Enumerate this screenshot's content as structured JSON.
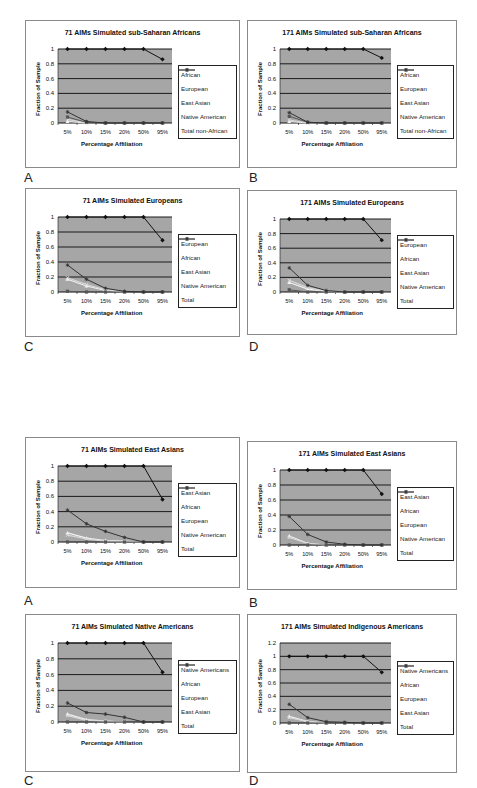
{
  "figure": {
    "x_ticks": [
      "5%",
      "10%",
      "15%",
      "20%",
      "50%",
      "95%"
    ],
    "xlabel": "Percentage Affiliation",
    "ylabel": "Fraction of Sample",
    "series_colors": {
      "primary": "#111111",
      "african_or_european": "#555555",
      "light1": "#f2f2f2",
      "light2": "#d8d8d8",
      "total": "#333333"
    },
    "plot_background": "#a6a6a6"
  },
  "panels": [
    {
      "id": "top-A",
      "letter": "A",
      "title": "71 AIMs Simulated sub-Saharan Africans",
      "legend": [
        "African",
        "European",
        "East Asian",
        "Native American",
        "Total non-African"
      ],
      "y_ticks": [
        "1",
        "0.8",
        "0.6",
        "0.4",
        "0.2",
        "0"
      ]
    },
    {
      "id": "top-B",
      "letter": "B",
      "title": "171 AIMs Simulated sub-Saharan Africans",
      "legend": [
        "African",
        "European",
        "East Asian",
        "Native American",
        "Total non-African"
      ],
      "y_ticks": [
        "1",
        "0.8",
        "0.6",
        "0.4",
        "0.2",
        "0"
      ]
    },
    {
      "id": "top-C",
      "letter": "C",
      "title": "71 AIMs Simulated Europeans",
      "legend": [
        "European",
        "African",
        "East Asian",
        "Native American",
        "Total"
      ],
      "y_ticks": [
        "1",
        "0.8",
        "0.6",
        "0.4",
        "0.2",
        "0"
      ]
    },
    {
      "id": "top-D",
      "letter": "D",
      "title": "171 AIMs Simulated Europeans",
      "legend": [
        "European",
        "African",
        "East Asian",
        "Native American",
        "Total"
      ],
      "y_ticks": [
        "1",
        "0.8",
        "0.6",
        "0.4",
        "0.2",
        "0"
      ]
    },
    {
      "id": "bottom-A",
      "letter": "A",
      "title": "71 AIMs Simulated East Asians",
      "legend": [
        "East Asian",
        "African",
        "European",
        "Native American",
        "Total"
      ],
      "y_ticks": [
        "1",
        "0.8",
        "0.6",
        "0.4",
        "0.2",
        "0"
      ]
    },
    {
      "id": "bottom-B",
      "letter": "B",
      "title": "171 AIMs Simulated East Asians",
      "legend": [
        "East Asian",
        "African",
        "European",
        "Native American",
        "Total"
      ],
      "y_ticks": [
        "1",
        "0.8",
        "0.6",
        "0.4",
        "0.2",
        "0"
      ]
    },
    {
      "id": "bottom-C",
      "letter": "C",
      "title": "71 AIMs Simulated Native Americans",
      "legend": [
        "Native Americans",
        "African",
        "European",
        "East Asian",
        "Total"
      ],
      "y_ticks": [
        "1",
        "0.8",
        "0.6",
        "0.4",
        "0.2",
        "0"
      ]
    },
    {
      "id": "bottom-D",
      "letter": "D",
      "title": "171 AIMs Simulated Indigenous Americans",
      "legend": [
        "Native Americans",
        "African",
        "European",
        "East Asian",
        "Total"
      ],
      "y_ticks": [
        "1.2",
        "1",
        "0.8",
        "0.6",
        "0.4",
        "0.2",
        "0"
      ]
    }
  ],
  "chart_data": [
    {
      "type": "line",
      "title": "71 AIMs Simulated sub-Saharan Africans",
      "panel": "A (top)",
      "categories": [
        "5%",
        "10%",
        "15%",
        "20%",
        "50%",
        "95%"
      ],
      "xlabel": "Percentage Affiliation",
      "ylabel": "Fraction of Sample",
      "ylim": [
        0,
        1
      ],
      "grid": true,
      "legend_position": "right",
      "series": [
        {
          "name": "African",
          "values": [
            1,
            1,
            1,
            1,
            1,
            0.86
          ]
        },
        {
          "name": "European",
          "values": [
            0.08,
            0.01,
            0,
            0,
            0,
            0
          ]
        },
        {
          "name": "East Asian",
          "values": [
            0.02,
            0,
            0,
            0,
            0,
            0
          ]
        },
        {
          "name": "Native American",
          "values": [
            0.05,
            0,
            0,
            0,
            0,
            0
          ]
        },
        {
          "name": "Total non-African",
          "values": [
            0.15,
            0.02,
            0,
            0,
            0,
            0
          ]
        }
      ]
    },
    {
      "type": "line",
      "title": "171 AIMs Simulated sub-Saharan Africans",
      "panel": "B (top)",
      "categories": [
        "5%",
        "10%",
        "15%",
        "20%",
        "50%",
        "95%"
      ],
      "xlabel": "Percentage Affiliation",
      "ylabel": "Fraction of Sample",
      "ylim": [
        0,
        1
      ],
      "grid": true,
      "legend_position": "right",
      "series": [
        {
          "name": "African",
          "values": [
            1,
            1,
            1,
            1,
            1,
            0.88
          ]
        },
        {
          "name": "European",
          "values": [
            0.09,
            0.01,
            0,
            0,
            0,
            0
          ]
        },
        {
          "name": "East Asian",
          "values": [
            0.02,
            0,
            0,
            0,
            0,
            0
          ]
        },
        {
          "name": "Native American",
          "values": [
            0.04,
            0,
            0,
            0,
            0,
            0
          ]
        },
        {
          "name": "Total non-African",
          "values": [
            0.14,
            0.01,
            0,
            0,
            0,
            0
          ]
        }
      ]
    },
    {
      "type": "line",
      "title": "71 AIMs Simulated Europeans",
      "panel": "C (top)",
      "categories": [
        "5%",
        "10%",
        "15%",
        "20%",
        "50%",
        "95%"
      ],
      "xlabel": "Percentage Affiliation",
      "ylabel": "Fraction of Sample",
      "ylim": [
        0,
        1
      ],
      "grid": true,
      "legend_position": "right",
      "series": [
        {
          "name": "European",
          "values": [
            1,
            1,
            1,
            1,
            1,
            0.69
          ]
        },
        {
          "name": "African",
          "values": [
            0.01,
            0,
            0,
            0,
            0,
            0
          ]
        },
        {
          "name": "East Asian",
          "values": [
            0.17,
            0.08,
            0.02,
            0,
            0,
            0
          ]
        },
        {
          "name": "Native American",
          "values": [
            0.19,
            0.1,
            0.03,
            0,
            0,
            0
          ]
        },
        {
          "name": "Total",
          "values": [
            0.36,
            0.17,
            0.05,
            0.01,
            0,
            0
          ]
        }
      ]
    },
    {
      "type": "line",
      "title": "171 AIMs Simulated Europeans",
      "panel": "D (top)",
      "categories": [
        "5%",
        "10%",
        "15%",
        "20%",
        "50%",
        "95%"
      ],
      "xlabel": "Percentage Affiliation",
      "ylabel": "Fraction of Sample",
      "ylim": [
        0,
        1
      ],
      "grid": true,
      "legend_position": "right",
      "series": [
        {
          "name": "European",
          "values": [
            1,
            1,
            1,
            1,
            1,
            0.71
          ]
        },
        {
          "name": "African",
          "values": [
            0.03,
            0,
            0,
            0,
            0,
            0
          ]
        },
        {
          "name": "East Asian",
          "values": [
            0.13,
            0.04,
            0.01,
            0,
            0,
            0
          ]
        },
        {
          "name": "Native American",
          "values": [
            0.16,
            0.06,
            0.01,
            0,
            0,
            0
          ]
        },
        {
          "name": "Total",
          "values": [
            0.33,
            0.09,
            0.02,
            0,
            0,
            0
          ]
        }
      ]
    },
    {
      "type": "line",
      "title": "71 AIMs Simulated East Asians",
      "panel": "A (bottom)",
      "categories": [
        "5%",
        "10%",
        "15%",
        "20%",
        "50%",
        "95%"
      ],
      "xlabel": "Percentage Affiliation",
      "ylabel": "Fraction of Sample",
      "ylim": [
        0,
        1
      ],
      "grid": true,
      "legend_position": "right",
      "series": [
        {
          "name": "East Asian",
          "values": [
            1,
            1,
            1,
            1,
            1,
            0.56
          ]
        },
        {
          "name": "African",
          "values": [
            0,
            0,
            0,
            0,
            0,
            0
          ]
        },
        {
          "name": "European",
          "values": [
            0.12,
            0.05,
            0.02,
            0.01,
            0,
            0
          ]
        },
        {
          "name": "Native American",
          "values": [
            0.09,
            0.04,
            0.01,
            0,
            0,
            0
          ]
        },
        {
          "name": "Total",
          "values": [
            0.42,
            0.24,
            0.14,
            0.06,
            0,
            0
          ]
        }
      ]
    },
    {
      "type": "line",
      "title": "171 AIMs Simulated East Asians",
      "panel": "B (bottom)",
      "categories": [
        "5%",
        "10%",
        "15%",
        "20%",
        "50%",
        "95%"
      ],
      "xlabel": "Percentage Affiliation",
      "ylabel": "Fraction of Sample",
      "ylim": [
        0,
        1
      ],
      "grid": true,
      "legend_position": "right",
      "series": [
        {
          "name": "East Asian",
          "values": [
            1,
            1,
            1,
            1,
            1,
            0.68
          ]
        },
        {
          "name": "African",
          "values": [
            0,
            0,
            0,
            0,
            0,
            0
          ]
        },
        {
          "name": "European",
          "values": [
            0.12,
            0.02,
            0,
            0,
            0,
            0
          ]
        },
        {
          "name": "Native American",
          "values": [
            0.1,
            0.02,
            0,
            0,
            0,
            0
          ]
        },
        {
          "name": "Total",
          "values": [
            0.38,
            0.14,
            0.04,
            0.01,
            0,
            0
          ]
        }
      ]
    },
    {
      "type": "line",
      "title": "71 AIMs Simulated Native Americans",
      "panel": "C (bottom)",
      "categories": [
        "5%",
        "10%",
        "15%",
        "20%",
        "50%",
        "95%"
      ],
      "xlabel": "Percentage Affiliation",
      "ylabel": "Fraction of Sample",
      "ylim": [
        0,
        1
      ],
      "grid": true,
      "legend_position": "right",
      "series": [
        {
          "name": "Native Americans",
          "values": [
            1,
            1,
            1,
            1,
            1,
            0.63
          ]
        },
        {
          "name": "African",
          "values": [
            0,
            0,
            0,
            0,
            0,
            0
          ]
        },
        {
          "name": "European",
          "values": [
            0.1,
            0.03,
            0.01,
            0,
            0,
            0
          ]
        },
        {
          "name": "East Asian",
          "values": [
            0.08,
            0.02,
            0.01,
            0,
            0,
            0
          ]
        },
        {
          "name": "Total",
          "values": [
            0.24,
            0.12,
            0.1,
            0.06,
            0,
            0
          ]
        }
      ]
    },
    {
      "type": "line",
      "title": "171 AIMs Simulated Indigenous Americans",
      "panel": "D (bottom)",
      "categories": [
        "5%",
        "10%",
        "15%",
        "20%",
        "50%",
        "95%"
      ],
      "xlabel": "Percentage Affiliation",
      "ylabel": "Fraction of Sample",
      "ylim": [
        0,
        1.2
      ],
      "grid": true,
      "legend_position": "right",
      "series": [
        {
          "name": "Native Americans",
          "values": [
            1,
            1,
            1,
            1,
            1,
            0.76
          ]
        },
        {
          "name": "African",
          "values": [
            0,
            0,
            0,
            0,
            0,
            0
          ]
        },
        {
          "name": "European",
          "values": [
            0.1,
            0.02,
            0,
            0,
            0,
            0
          ]
        },
        {
          "name": "East Asian",
          "values": [
            0.08,
            0.02,
            0,
            0,
            0,
            0
          ]
        },
        {
          "name": "Total",
          "values": [
            0.28,
            0.08,
            0.02,
            0.01,
            0,
            0
          ]
        }
      ]
    }
  ]
}
